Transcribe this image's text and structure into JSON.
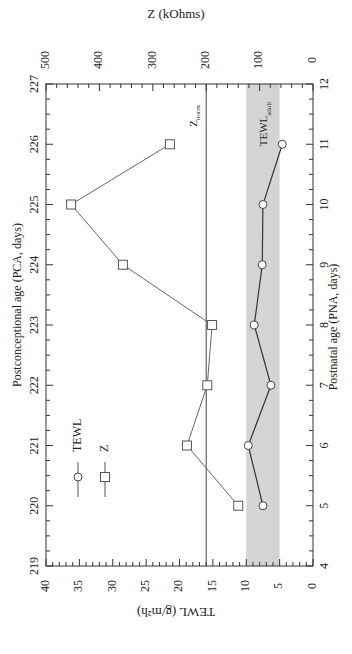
{
  "chart_data": {
    "type": "line",
    "orientation": "rotated-90-ccw",
    "title": "",
    "x_axes": {
      "primary": {
        "label": "Postnatal age (PNA, days)",
        "range": [
          4,
          12
        ],
        "ticks": [
          4,
          5,
          6,
          7,
          8,
          9,
          10,
          11,
          12
        ]
      },
      "secondary": {
        "label": "Postconceptional age (PCA, days)",
        "range": [
          219,
          227
        ],
        "ticks": [
          219,
          220,
          221,
          222,
          223,
          224,
          225,
          226,
          227
        ]
      }
    },
    "y_axes": {
      "left": {
        "label": "TEWL (g/m²h)",
        "range": [
          0,
          40
        ],
        "ticks": [
          0,
          5,
          10,
          15,
          20,
          25,
          30,
          35,
          40
        ]
      },
      "right": {
        "label": "Z (kOhms)",
        "range": [
          0,
          500
        ],
        "ticks": [
          0,
          100,
          200,
          300,
          400,
          500
        ]
      }
    },
    "x": [
      5,
      6,
      7,
      8,
      9,
      10,
      11
    ],
    "series": [
      {
        "name": "TEWL",
        "marker": "circle",
        "axis": "left",
        "values": [
          7.5,
          9.7,
          6.3,
          8.8,
          7.6,
          7.5,
          4.6
        ]
      },
      {
        "name": "Z",
        "marker": "square",
        "axis": "right",
        "values": [
          140,
          236,
          198,
          189,
          356,
          453,
          268
        ]
      }
    ],
    "annotations": [
      {
        "type": "hline",
        "label": "Z",
        "label_sub": "norm",
        "value_left_axis": 16,
        "value_right_axis": 200
      },
      {
        "type": "band",
        "label": "TEWL",
        "label_sub": "adult",
        "range_left_axis": [
          5,
          10
        ],
        "color": "#d6d6d6"
      }
    ],
    "legend": {
      "position": "inside-lower-left",
      "entries": [
        "TEWL",
        "Z"
      ]
    },
    "grid": false
  },
  "labels": {
    "z_title": "Z (kOhms)",
    "tewl_title": "TEWL (g/m²h)",
    "pca_title": "Postconceptional age (PCA, days)",
    "pna_title": "Postnatal age (PNA, days)"
  },
  "colors": {
    "axis": "#333333",
    "line": "#444444",
    "band": "#d4d4d4",
    "marker_fill": "#ffffff"
  }
}
